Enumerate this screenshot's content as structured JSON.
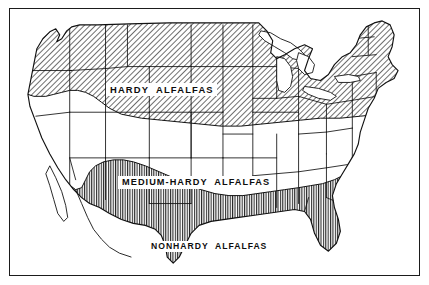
{
  "figure": {
    "kind": "thematic-map",
    "region": "United States",
    "title_visible": false,
    "frame": {
      "style": "thin-black-rectangle",
      "border_color": "#1b1b1b",
      "background_color": "#ffffff"
    }
  },
  "map": {
    "projection_look": "conic",
    "outline_color": "#111111",
    "water_fill": "#ffffff",
    "land_fill": "#ffffff",
    "state_borders_visible": true,
    "great_lakes_visible": true,
    "labels": [
      {
        "id": "hardy",
        "text": "HARDY  ALFALFAS"
      },
      {
        "id": "medium_hardy",
        "text": "MEDIUM-HARDY  ALFALFAS"
      },
      {
        "id": "nonhardy",
        "text": "NONHARDY  ALFALFAS"
      }
    ]
  },
  "zones": [
    {
      "id": "hardy",
      "name": "HARDY  ALFALFAS",
      "pattern": "diagonal-hatch",
      "pattern_angle_deg": 45,
      "pattern_color": "#3f3f3f",
      "fill_tone": "#ffffff",
      "position": "northern-tier",
      "description": "Northern band spanning the Pacific Northwest, northern Rockies, northern Plains, Great Lakes states and New England."
    },
    {
      "id": "medium_hardy",
      "name": "MEDIUM-HARDY  ALFALFAS",
      "pattern": "none",
      "pattern_color": "#ffffff",
      "fill_tone": "#ffffff",
      "position": "central-tier",
      "description": "Unshaded central band from California and the Southwest across the central Plains to the mid-Atlantic and upper South."
    },
    {
      "id": "nonhardy",
      "name": "NONHARDY  ALFALFAS",
      "pattern": "vertical-hatch",
      "pattern_angle_deg": 90,
      "pattern_color": "#1f1f1f",
      "fill_tone": "#ffffff",
      "position": "southern-coastal-fringe",
      "description": "Narrow southern fringe along the southern California coast, the Mexican border, south Texas, the Gulf Coast, the South Atlantic coast and all of Florida."
    }
  ],
  "colors": {
    "ink": "#111111",
    "paper": "#ffffff",
    "hatch_dark": "#1f1f1f",
    "hatch_light": "#3f3f3f",
    "frame": "#1b1b1b"
  }
}
